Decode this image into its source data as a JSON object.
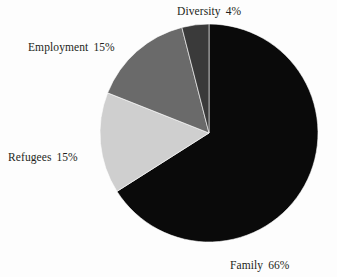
{
  "chart_data": {
    "type": "pie",
    "title": "",
    "subtitle": "",
    "xlabel": "",
    "ylabel": "",
    "legend_position": "none",
    "grid": false,
    "units": "percent",
    "start_angle_deg": 0,
    "direction": "clockwise",
    "center": {
      "x": 209,
      "y": 133
    },
    "radius": 109,
    "categories": [
      "Family",
      "Refugees",
      "Employment",
      "Diversity"
    ],
    "values": [
      66,
      15,
      15,
      4
    ],
    "slices": [
      {
        "label": "Family",
        "value": 66,
        "percent_text": "66%",
        "color": "#0a0a0a",
        "start_deg": 0,
        "end_deg": 237.6,
        "label_position": "bottom-right"
      },
      {
        "label": "Refugees",
        "value": 15,
        "percent_text": "15%",
        "color": "#cfcfcf",
        "start_deg": 237.6,
        "end_deg": 291.6,
        "label_position": "left"
      },
      {
        "label": "Employment",
        "value": 15,
        "percent_text": "15%",
        "color": "#6a6a6a",
        "start_deg": 291.6,
        "end_deg": 345.6,
        "label_position": "upper-left"
      },
      {
        "label": "Diversity",
        "value": 4,
        "percent_text": "4%",
        "color": "#3a3a3a",
        "start_deg": 345.6,
        "end_deg": 360,
        "label_position": "top"
      }
    ]
  },
  "labels": {
    "diversity": {
      "name": "Diversity",
      "percent": "4%"
    },
    "employment": {
      "name": "Employment",
      "percent": "15%"
    },
    "refugees": {
      "name": "Refugees",
      "percent": "15%"
    },
    "family": {
      "name": "Family",
      "percent": "66%"
    }
  },
  "colors": {
    "background": "#fdfdfd",
    "text": "#231f20",
    "family": "#0a0a0a",
    "refugees": "#cfcfcf",
    "employment": "#6a6a6a",
    "diversity": "#3a3a3a",
    "slice_outline": "#ffffff"
  }
}
